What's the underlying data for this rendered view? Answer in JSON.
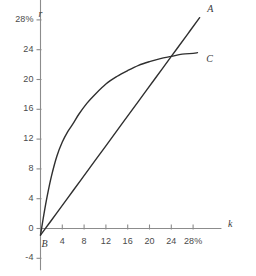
{
  "chart_data": {
    "type": "line",
    "title": "",
    "xlabel": "k",
    "ylabel": "r",
    "xlim": [
      -2,
      32
    ],
    "ylim": [
      -5,
      31
    ],
    "grid": false,
    "legend_position": "inline-right-of-curve",
    "x_ticks": [
      4,
      8,
      12,
      16,
      20,
      24,
      28
    ],
    "x_tick_labels": [
      "4",
      "8",
      "12",
      "16",
      "20",
      "24",
      "28%"
    ],
    "y_ticks": [
      -4,
      0,
      4,
      8,
      12,
      16,
      20,
      24,
      28
    ],
    "y_tick_labels": [
      "-4",
      "0",
      "4",
      "8",
      "12",
      "16",
      "20",
      "24",
      "28%"
    ],
    "annotations": [
      {
        "name": "origin-point-label",
        "text": "B",
        "x": 0.2,
        "y": -2.2
      }
    ],
    "series": [
      {
        "name": "A",
        "label": "A",
        "shape": "straight-line",
        "label_x": 30.6,
        "label_y": 29.3,
        "x": [
          0.0,
          1.5,
          3.0,
          6.0,
          9.0,
          12.0,
          15.0,
          18.0,
          21.0,
          24.0,
          27.0,
          29.2
        ],
        "y": [
          -0.9,
          0.6,
          2.1,
          5.1,
          8.1,
          11.1,
          14.1,
          17.1,
          20.1,
          23.1,
          26.1,
          28.3
        ]
      },
      {
        "name": "C",
        "label": "C",
        "shape": "concave-increasing",
        "label_x": 30.4,
        "label_y": 22.6,
        "x": [
          0.0,
          0.6,
          1.3,
          2.0,
          3.0,
          4.0,
          5.0,
          6.0,
          7.0,
          8.5,
          10.0,
          12.0,
          14.0,
          16.0,
          18.0,
          20.0,
          22.0,
          24.0,
          26.0,
          28.0,
          28.8
        ],
        "y": [
          -0.9,
          1.8,
          4.6,
          7.0,
          9.7,
          11.6,
          13.0,
          14.1,
          15.3,
          16.8,
          18.0,
          19.4,
          20.4,
          21.2,
          21.9,
          22.4,
          22.8,
          23.1,
          23.4,
          23.5,
          23.6
        ]
      }
    ],
    "intersection": {
      "x": 22.6,
      "y": 22.9
    },
    "colors": {
      "background": "#ffffff",
      "axis": "#8c8c8c",
      "curve": "#2f2f2f",
      "text": "#3a3a3a"
    }
  }
}
